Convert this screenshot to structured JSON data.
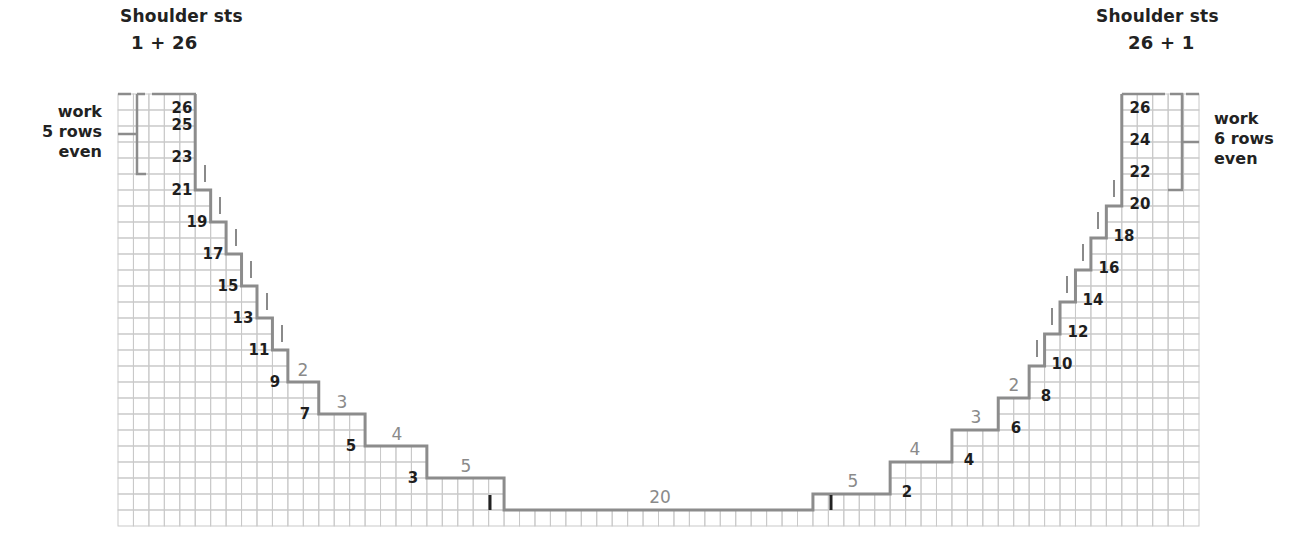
{
  "title_left": {
    "line1": "Shoulder sts",
    "line2": "1 + 26"
  },
  "title_right": {
    "line1": "Shoulder sts",
    "line2": "26 + 1"
  },
  "note_left": {
    "line1": "work",
    "line2": "5 rows",
    "line3": "even"
  },
  "note_right": {
    "line1": "work",
    "line2": "6 rows",
    "line3": "even"
  },
  "colors": {
    "grid": "#c9c9c9",
    "outline": "#8c8c8c",
    "row_label": "#1e1e1e",
    "step_label": "#8a8a8a",
    "tick": "#8a8a8a"
  },
  "grid": {
    "cols": 70,
    "rows": 27,
    "origin_x": 118,
    "origin_y": 94,
    "cell_w": 15.443,
    "cell_h": 16
  },
  "left_steps": [
    {
      "cols": [
        0,
        4
      ],
      "height": 27
    },
    {
      "cols": [
        5,
        5
      ],
      "height": 21
    },
    {
      "cols": [
        6,
        6
      ],
      "height": 19
    },
    {
      "cols": [
        7,
        7
      ],
      "height": 17
    },
    {
      "cols": [
        8,
        8
      ],
      "height": 15
    },
    {
      "cols": [
        9,
        9
      ],
      "height": 13
    },
    {
      "cols": [
        10,
        10
      ],
      "height": 11
    },
    {
      "cols": [
        11,
        12
      ],
      "height": 9
    },
    {
      "cols": [
        13,
        15
      ],
      "height": 7
    },
    {
      "cols": [
        16,
        19
      ],
      "height": 5
    },
    {
      "cols": [
        20,
        24
      ],
      "height": 3
    }
  ],
  "center_step": {
    "cols": [
      25,
      44
    ],
    "height": 1,
    "label": "20"
  },
  "right_steps": [
    {
      "cols": [
        45,
        49
      ],
      "height": 2
    },
    {
      "cols": [
        50,
        53
      ],
      "height": 4
    },
    {
      "cols": [
        54,
        56
      ],
      "height": 6
    },
    {
      "cols": [
        57,
        58
      ],
      "height": 8
    },
    {
      "cols": [
        59,
        59
      ],
      "height": 10
    },
    {
      "cols": [
        60,
        60
      ],
      "height": 12
    },
    {
      "cols": [
        61,
        61
      ],
      "height": 14
    },
    {
      "cols": [
        62,
        62
      ],
      "height": 16
    },
    {
      "cols": [
        63,
        63
      ],
      "height": 18
    },
    {
      "cols": [
        64,
        64
      ],
      "height": 20
    },
    {
      "cols": [
        65,
        69
      ],
      "height": 27
    }
  ],
  "left_row_labels": [
    {
      "text": "26",
      "x": 182,
      "y": 107
    },
    {
      "text": "25",
      "x": 182,
      "y": 124
    },
    {
      "text": "23",
      "x": 182,
      "y": 156
    },
    {
      "text": "21",
      "x": 182,
      "y": 189
    },
    {
      "text": "19",
      "x": 197,
      "y": 221
    },
    {
      "text": "17",
      "x": 213,
      "y": 253
    },
    {
      "text": "15",
      "x": 228,
      "y": 285
    },
    {
      "text": "13",
      "x": 243,
      "y": 317
    },
    {
      "text": "11",
      "x": 259,
      "y": 349
    },
    {
      "text": "9",
      "x": 275,
      "y": 381
    },
    {
      "text": "7",
      "x": 305,
      "y": 413
    },
    {
      "text": "5",
      "x": 351,
      "y": 445
    },
    {
      "text": "3",
      "x": 413,
      "y": 477
    },
    {
      "text": "1",
      "x": 490,
      "y": 509
    }
  ],
  "right_row_labels": [
    {
      "text": "26",
      "x": 1140,
      "y": 107
    },
    {
      "text": "24",
      "x": 1140,
      "y": 139
    },
    {
      "text": "22",
      "x": 1140,
      "y": 171
    },
    {
      "text": "20",
      "x": 1140,
      "y": 203
    },
    {
      "text": "18",
      "x": 1124,
      "y": 235
    },
    {
      "text": "16",
      "x": 1109,
      "y": 267
    },
    {
      "text": "14",
      "x": 1093,
      "y": 299
    },
    {
      "text": "12",
      "x": 1078,
      "y": 331
    },
    {
      "text": "10",
      "x": 1062,
      "y": 363
    },
    {
      "text": "8",
      "x": 1046,
      "y": 395
    },
    {
      "text": "6",
      "x": 1016,
      "y": 427
    },
    {
      "text": "4",
      "x": 969,
      "y": 459
    },
    {
      "text": "2",
      "x": 907,
      "y": 491
    },
    {
      "text": "1",
      "x": 831,
      "y": 509
    }
  ],
  "left_step_labels": [
    {
      "text": "2",
      "x": 303,
      "y": 376
    },
    {
      "text": "3",
      "x": 342,
      "y": 408
    },
    {
      "text": "4",
      "x": 397,
      "y": 440
    },
    {
      "text": "5",
      "x": 466,
      "y": 472
    }
  ],
  "right_step_labels": [
    {
      "text": "5",
      "x": 853,
      "y": 487
    },
    {
      "text": "4",
      "x": 915,
      "y": 455
    },
    {
      "text": "3",
      "x": 976,
      "y": 423
    },
    {
      "text": "2",
      "x": 1014,
      "y": 391
    }
  ],
  "center_label": {
    "text": "20",
    "x": 660,
    "y": 503
  },
  "left_ticks": [
    {
      "x": 205,
      "y1": 165,
      "y2": 182
    },
    {
      "x": 220,
      "y1": 197,
      "y2": 214
    },
    {
      "x": 236,
      "y1": 229,
      "y2": 246
    },
    {
      "x": 251,
      "y1": 261,
      "y2": 278
    },
    {
      "x": 267,
      "y1": 293,
      "y2": 310
    },
    {
      "x": 282,
      "y1": 325,
      "y2": 342
    }
  ],
  "right_ticks": [
    {
      "x": 1114,
      "y1": 180,
      "y2": 197
    },
    {
      "x": 1098,
      "y1": 212,
      "y2": 229
    },
    {
      "x": 1083,
      "y1": 244,
      "y2": 261
    },
    {
      "x": 1067,
      "y1": 276,
      "y2": 293
    },
    {
      "x": 1052,
      "y1": 308,
      "y2": 325
    },
    {
      "x": 1037,
      "y1": 340,
      "y2": 357
    }
  ],
  "marks": [
    {
      "x": 490,
      "y1": 495,
      "y2": 510
    },
    {
      "x": 831,
      "y1": 495,
      "y2": 510
    }
  ]
}
